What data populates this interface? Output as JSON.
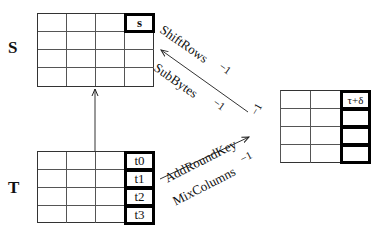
{
  "labels": {
    "s_matrix": "S",
    "t_matrix": "T"
  },
  "s_grid": {
    "rows": 4,
    "cols": 4,
    "highlight_cell": "s"
  },
  "t_grid": {
    "rows": 4,
    "cols": 4,
    "column_cells": [
      "t0",
      "t1",
      "t2",
      "t3"
    ]
  },
  "right_grid": {
    "rows": 4,
    "cols": 4,
    "highlight_cell": "τ+δ"
  },
  "arrows": {
    "upper": {
      "top_label": "ShiftRows",
      "top_exp": "−1",
      "bottom_label": "SubBytes",
      "bottom_exp": "−1",
      "corner_exp": "−1"
    },
    "lower": {
      "top_label": "AddRoundKey",
      "bottom_label": "MixColumns",
      "bottom_exp": "−1"
    }
  }
}
